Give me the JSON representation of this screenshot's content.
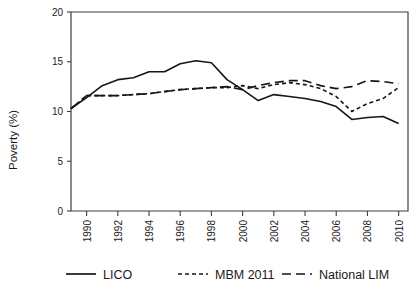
{
  "chart_data": {
    "type": "line",
    "title": "",
    "xlabel": "",
    "ylabel": "Poverty (%)",
    "xlim": [
      1989,
      2010.6
    ],
    "ylim": [
      0,
      20
    ],
    "grid": false,
    "legend_position": "bottom",
    "x_tick_labels": [
      "1990",
      "1992",
      "1994",
      "1996",
      "1998",
      "2000",
      "2002",
      "2004",
      "2006",
      "2008",
      "2010"
    ],
    "x_ticks": [
      1990,
      1992,
      1994,
      1996,
      1998,
      2000,
      2002,
      2004,
      2006,
      2008,
      2010
    ],
    "y_tick_labels": [
      "0",
      "5",
      "10",
      "15",
      "20"
    ],
    "y_ticks": [
      0,
      5,
      10,
      15,
      20
    ],
    "x": [
      1989,
      1990,
      1991,
      1992,
      1993,
      1994,
      1995,
      1996,
      1997,
      1998,
      1999,
      2000,
      2001,
      2002,
      2003,
      2004,
      2005,
      2006,
      2007,
      2008,
      2009,
      2010
    ],
    "series": [
      {
        "name": "LICO",
        "dash": "none",
        "values": [
          10.3,
          11.4,
          12.6,
          13.2,
          13.4,
          14.0,
          14.0,
          14.8,
          15.1,
          14.9,
          13.2,
          12.2,
          11.1,
          11.7,
          11.5,
          11.3,
          11.0,
          10.5,
          9.2,
          9.4,
          9.5,
          8.8
        ]
      },
      {
        "name": "MBM 2011",
        "dash": "short",
        "values": [
          10.3,
          11.6,
          11.6,
          11.6,
          11.7,
          11.8,
          12.0,
          12.2,
          12.3,
          12.4,
          12.4,
          12.6,
          12.3,
          12.7,
          12.9,
          12.7,
          12.3,
          11.5,
          10.0,
          10.8,
          11.3,
          12.4
        ]
      },
      {
        "name": "National LIM",
        "dash": "long",
        "values": [
          10.3,
          11.6,
          11.6,
          11.6,
          11.7,
          11.8,
          12.0,
          12.2,
          12.3,
          12.4,
          12.5,
          12.2,
          12.6,
          12.9,
          13.1,
          13.1,
          12.6,
          12.3,
          12.5,
          13.1,
          13.0,
          12.8
        ]
      }
    ],
    "legend": [
      {
        "label": "LICO",
        "dash": "none"
      },
      {
        "label": "MBM 2011",
        "dash": "short"
      },
      {
        "label": "National LIM",
        "dash": "long"
      }
    ],
    "colors": {
      "line": "#161616",
      "axis": "#3d3d3d",
      "background": "#ffffff"
    }
  }
}
